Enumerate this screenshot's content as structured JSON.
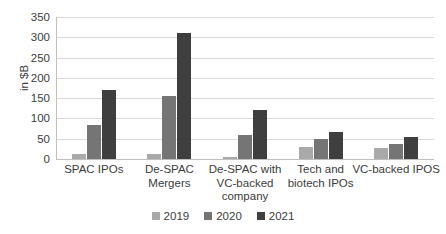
{
  "chart_data": {
    "type": "bar",
    "title": "",
    "subtitle": "",
    "xlabel": "",
    "ylabel": "in $B",
    "ylim": [
      0,
      350
    ],
    "ytick_step": 50,
    "yticks": [
      "0",
      "50",
      "100",
      "150",
      "200",
      "250",
      "300",
      "350"
    ],
    "grid": true,
    "legend_position": "bottom",
    "categories": [
      "SPAC IPOs",
      "De-SPAC Mergers",
      "De-SPAC with VC-backed company",
      "Tech and biotech IPOs",
      "VC-backed IPOS"
    ],
    "category_lines": [
      [
        "SPAC IPOs"
      ],
      [
        "De-SPAC",
        "Mergers"
      ],
      [
        "De-SPAC with",
        "VC-backed",
        "company"
      ],
      [
        "Tech and",
        "biotech IPOs"
      ],
      [
        "VC-backed IPOS"
      ]
    ],
    "series": [
      {
        "name": "2019",
        "color": "#a9a9a9",
        "values": [
          13,
          13,
          5,
          30,
          26
        ]
      },
      {
        "name": "2020",
        "color": "#757575",
        "values": [
          83,
          156,
          60,
          50,
          38
        ]
      },
      {
        "name": "2021",
        "color": "#3f3f3f",
        "values": [
          170,
          311,
          122,
          66,
          55
        ]
      }
    ]
  },
  "legend": {
    "items": [
      {
        "label": "2019",
        "color": "#a9a9a9"
      },
      {
        "label": "2020",
        "color": "#757575"
      },
      {
        "label": "2021",
        "color": "#3f3f3f"
      }
    ]
  }
}
